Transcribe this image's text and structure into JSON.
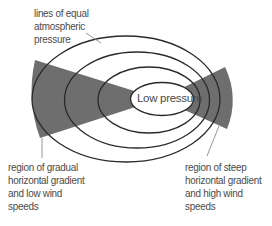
{
  "diagram": {
    "center_label": "Low pressure",
    "labels": {
      "isobars": [
        "lines of equal",
        "atmospheric",
        "pressure"
      ],
      "gradual_region": [
        "region of gradual",
        "horizontal gradient",
        "and low wind",
        "speeds"
      ],
      "steep_region": [
        "region of steep",
        "horizontal gradient",
        "and high wind",
        "speeds"
      ]
    },
    "isobar_count": 4,
    "colors": {
      "wedge_fill": "#6e6e6e",
      "isobar_stroke": "#2a2a2a",
      "text": "#4a4a4a",
      "leader_line": "#8a8a8a",
      "background": "#ffffff"
    }
  }
}
